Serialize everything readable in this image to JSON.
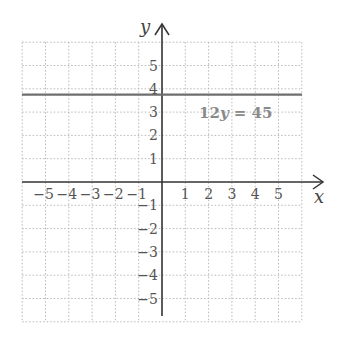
{
  "chart_data": {
    "type": "line",
    "title": "",
    "xlabel": "x",
    "ylabel": "y",
    "xlim": [
      -6,
      6
    ],
    "ylim": [
      -6,
      6
    ],
    "grid": true,
    "x_ticks": [
      "-5",
      "-4",
      "-3",
      "-2",
      "-1",
      "1",
      "2",
      "3",
      "4",
      "5"
    ],
    "y_ticks": [
      "5",
      "4",
      "3",
      "2",
      "1",
      "-1",
      "-2",
      "-3",
      "-4",
      "-5"
    ],
    "series": [
      {
        "name": "12y = 45",
        "equation": "y = 3.75",
        "x": [
          -6,
          6
        ],
        "y": [
          3.75,
          3.75
        ]
      }
    ],
    "annotations": [
      {
        "text": "12y = 45",
        "x": 1.3,
        "y": 3
      }
    ],
    "line_color": "#6e6e6e"
  },
  "labels": {
    "x_axis": "x",
    "y_axis": "y",
    "equation_prefix": "12",
    "equation_var": "y",
    "equation_suffix": " = 45"
  }
}
